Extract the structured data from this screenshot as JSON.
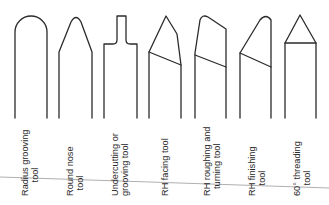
{
  "diagram": {
    "type": "lathe-cutting-tool-profiles",
    "tools": [
      {
        "id": "radius-grooving",
        "label_line1": "Radius grooving",
        "label_line2": "tool"
      },
      {
        "id": "round-nose",
        "label_line1": "Round nose",
        "label_line2": "tool"
      },
      {
        "id": "undercutting",
        "label_line1": "Undercutting or",
        "label_line2": "grooving tool"
      },
      {
        "id": "rh-facing",
        "label_line1": "RH facing tool",
        "label_line2": ""
      },
      {
        "id": "rh-roughing",
        "label_line1": "RH roughing and",
        "label_line2": "turning tool"
      },
      {
        "id": "rh-finishing",
        "label_line1": "RH finishing",
        "label_line2": "tool"
      },
      {
        "id": "threading-60",
        "label_line1": "60° threading",
        "label_line2": "tool"
      }
    ],
    "colors": {
      "stroke": "#2b2b2b",
      "divider": "#9a9a9a",
      "background": "#ffffff"
    }
  }
}
